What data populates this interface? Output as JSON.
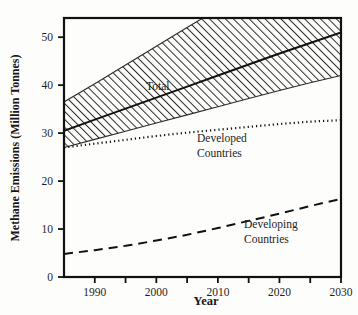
{
  "chart_data": {
    "type": "line",
    "title": "",
    "xlabel": "Year",
    "ylabel": "Methane Emissions (Million Tonnes)",
    "xlim": [
      1985,
      2030
    ],
    "ylim": [
      0,
      54
    ],
    "grid": false,
    "legend_position": "inline-annotations",
    "x_ticks_major": [
      1990,
      2000,
      2010,
      2020,
      2030
    ],
    "x_ticks_minor": [
      1995,
      2005,
      2015,
      2025
    ],
    "y_ticks_major": [
      0,
      10,
      20,
      30,
      40,
      50
    ],
    "x": [
      1985,
      1990,
      1995,
      2000,
      2005,
      2010,
      2015,
      2020,
      2025,
      2030
    ],
    "series": [
      {
        "name": "Total",
        "style": "solid",
        "values": [
          30.5,
          32.8,
          35.1,
          37.4,
          39.7,
          42.0,
          44.3,
          46.6,
          48.8,
          51.0
        ]
      },
      {
        "name": "Total uncertainty band upper",
        "style": "hatched-band-upper",
        "values": [
          36.5,
          40.3,
          44.2,
          48.1,
          52.0,
          55.9,
          59.8,
          63.7,
          67.6,
          71.5
        ]
      },
      {
        "name": "Total uncertainty band lower",
        "style": "hatched-band-lower",
        "values": [
          27.0,
          28.7,
          30.4,
          32.1,
          33.8,
          35.5,
          37.2,
          38.9,
          40.5,
          42.0
        ]
      },
      {
        "name": "Developed Countries",
        "style": "dotted",
        "values": [
          27.0,
          27.8,
          28.6,
          29.4,
          30.1,
          30.7,
          31.3,
          31.9,
          32.4,
          32.7
        ]
      },
      {
        "name": "Developing Countries",
        "style": "dashed",
        "values": [
          4.8,
          5.6,
          6.5,
          7.6,
          8.8,
          10.2,
          11.7,
          13.2,
          14.8,
          16.3
        ]
      }
    ],
    "annotations": [
      {
        "name": "Total",
        "text": "Total",
        "x": 1998.5,
        "y": 40.5
      },
      {
        "name": "Developed Countries",
        "text_line1": "Developed",
        "text_line2": "Countries",
        "x": 2007,
        "y": 28.0
      },
      {
        "name": "Developing Countries",
        "text_line1": "Developing",
        "text_line2": "Countries",
        "x": 2015.5,
        "y": 11.5
      }
    ]
  },
  "axes": {
    "y_title": "Methane Emissions (Million Tonnes)",
    "x_title": "Year",
    "y_tick_labels": [
      "0",
      "10",
      "20",
      "30",
      "40",
      "50"
    ],
    "x_tick_labels": [
      "1990",
      "2000",
      "2010",
      "2020",
      "2030"
    ]
  },
  "annotations": {
    "total": "Total",
    "developed_line1": "Developed",
    "developed_line2": "Countries",
    "developing_line1": "Developing",
    "developing_line2": "Countries"
  },
  "colors": {
    "ink": "#1b1b1b",
    "background": "#fdfdfc",
    "hatch": "#2b2b2b"
  }
}
